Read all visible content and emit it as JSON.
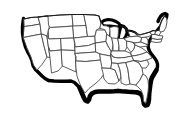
{
  "figure": {
    "kind": "outline-map",
    "title": "",
    "caption": "",
    "labels_visible": false,
    "background_color": "#ffffff",
    "interior_border_color": "#4a4a4a",
    "coastline_color": "#000000",
    "fill_color": "#ffffff",
    "width_px": 179,
    "height_px": 117
  },
  "map": {
    "projection_note": "Simplified flat outline, state boundaries shown as thin lines; ocean, Gulf and Great Lakes shorelines drawn with a heavy black stroke.",
    "regions": [
      {
        "id": "pacific-northwest",
        "names": [
          "Washington",
          "Oregon",
          "Idaho"
        ]
      },
      {
        "id": "california-great-basin",
        "names": [
          "California",
          "Nevada",
          "Utah",
          "Arizona"
        ]
      },
      {
        "id": "northern-rockies-plains",
        "names": [
          "Montana",
          "Wyoming",
          "North Dakota",
          "South Dakota"
        ]
      },
      {
        "id": "southwest",
        "names": [
          "New Mexico",
          "Colorado",
          "Texas",
          "Oklahoma"
        ]
      },
      {
        "id": "great-plains",
        "names": [
          "Nebraska",
          "Kansas",
          "Iowa",
          "Missouri"
        ]
      },
      {
        "id": "great-lakes",
        "names": [
          "Minnesota",
          "Wisconsin",
          "Michigan",
          "Illinois",
          "Indiana",
          "Ohio"
        ]
      },
      {
        "id": "southeast",
        "names": [
          "Arkansas",
          "Louisiana",
          "Mississippi",
          "Alabama",
          "Georgia",
          "Florida",
          "Tennessee",
          "Kentucky",
          "South Carolina",
          "North Carolina"
        ]
      },
      {
        "id": "mid-atlantic",
        "names": [
          "Virginia",
          "West Virginia",
          "Maryland",
          "Delaware",
          "Pennsylvania",
          "New Jersey",
          "New York"
        ]
      },
      {
        "id": "new-england",
        "names": [
          "Maine",
          "New Hampshire",
          "Vermont",
          "Massachusetts",
          "Rhode Island",
          "Connecticut"
        ]
      }
    ],
    "water_bodies": [
      {
        "id": "pacific-ocean",
        "name": "Pacific Ocean"
      },
      {
        "id": "atlantic-ocean",
        "name": "Atlantic Ocean"
      },
      {
        "id": "gulf-of-mexico",
        "name": "Gulf of Mexico"
      },
      {
        "id": "great-lakes",
        "name": "Great Lakes"
      }
    ]
  }
}
